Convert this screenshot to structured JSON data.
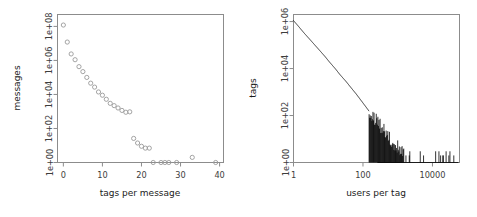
{
  "figure": {
    "background": "#ffffff",
    "panel_count": 2,
    "point_color": "#9a9a9a",
    "line_color": "#111111",
    "axis_color": "#8c8c8c"
  },
  "chart_data": [
    {
      "id": "left-panel",
      "type": "scatter",
      "title": "",
      "xlabel": "tags per message",
      "ylabel": "messages",
      "xscale": "linear",
      "yscale": "log",
      "grid": false,
      "legend": null,
      "xlim": [
        -1.5,
        41
      ],
      "ylim": [
        1,
        500000000
      ],
      "xticks": [
        0,
        10,
        20,
        30,
        40
      ],
      "xticklabels": [
        "0",
        "10",
        "20",
        "30",
        "40"
      ],
      "yticks": [
        1,
        100,
        10000,
        1000000,
        100000000
      ],
      "yticklabels": [
        "1e+00",
        "1e+02",
        "1e+04",
        "1e+06",
        "1e+08"
      ],
      "x": [
        0,
        1,
        2,
        3,
        4,
        5,
        6,
        7,
        8,
        9,
        10,
        11,
        12,
        13,
        14,
        15,
        16,
        17,
        18,
        19,
        20,
        21,
        22,
        23,
        25,
        26,
        27,
        29,
        33,
        39
      ],
      "y": [
        120000000,
        12000000,
        2400000,
        1100000,
        430000,
        220000,
        100000,
        46000,
        27000,
        14000,
        9000,
        5200,
        3000,
        2200,
        1600,
        1150,
        900,
        950,
        26,
        14,
        9,
        7,
        7,
        1,
        1,
        1,
        1,
        1,
        2,
        1
      ]
    },
    {
      "id": "right-panel",
      "type": "line",
      "title": "",
      "xlabel": "users per tag",
      "ylabel": "tags",
      "xscale": "log",
      "yscale": "log",
      "grid": false,
      "legend": null,
      "xlim": [
        1,
        60000
      ],
      "ylim": [
        1,
        2000000
      ],
      "xticks": [
        1,
        100,
        10000
      ],
      "xticklabels": [
        "1",
        "100",
        "10000"
      ],
      "yticks": [
        1,
        100,
        10000,
        1000000
      ],
      "yticklabels": [
        "1e+00",
        "1e+02",
        "1e+04",
        "1e+06"
      ],
      "description": "Monotonically decreasing power-law curve from ~1.1e6 tags at 1 user per tag down to 1 tag, becoming a noisy spiky band below 1e+02 beyond ~150 users per tag, with sparse single-tag spikes extending to ~40000 users per tag.",
      "x": [
        1,
        1.4,
        2,
        2.8,
        4,
        5.6,
        8,
        11,
        16,
        22,
        32,
        45,
        64,
        90,
        128,
        180,
        256,
        360,
        512,
        720,
        1024,
        1450,
        2048,
        2900,
        4096,
        5800,
        8192,
        11600,
        16384
      ],
      "y": [
        1100000,
        620000,
        330000,
        190000,
        105000,
        60000,
        33000,
        18500,
        9800,
        5400,
        2900,
        1550,
        820,
        420,
        210,
        105,
        52,
        26,
        13,
        7,
        4,
        3,
        2,
        2,
        1,
        1,
        1,
        1,
        1
      ]
    }
  ]
}
